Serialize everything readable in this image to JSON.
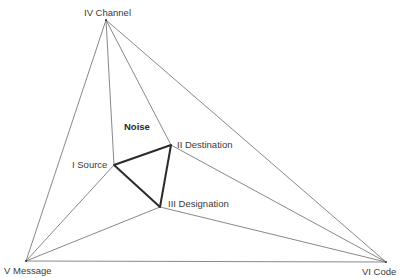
{
  "diagram": {
    "width": 406,
    "height": 278,
    "colors": {
      "thin_line": "#6a6a6a",
      "bold_line": "#2a2a2a",
      "text": "#3a3a3a",
      "background": "#ffffff"
    },
    "nodes": {
      "channel": {
        "label": "IV  Channel",
        "x": 106,
        "y": 20,
        "label_x": 84,
        "label_y": 16
      },
      "source": {
        "label": "I  Source",
        "x": 114,
        "y": 165,
        "label_x": 72,
        "label_y": 168
      },
      "destination": {
        "label": "II  Destination",
        "x": 171,
        "y": 145,
        "label_x": 177,
        "label_y": 148
      },
      "designation": {
        "label": "III  Designation",
        "x": 160,
        "y": 207,
        "label_x": 168,
        "label_y": 207
      },
      "message": {
        "label": "V  Message",
        "x": 26,
        "y": 261,
        "label_x": 4,
        "label_y": 274
      },
      "code": {
        "label": "VI  Code",
        "x": 386,
        "y": 262,
        "label_x": 362,
        "label_y": 275
      }
    },
    "annotation": {
      "text": "Noise",
      "x": 124,
      "y": 130
    },
    "edges_thin": [
      [
        "channel",
        "source"
      ],
      [
        "channel",
        "destination"
      ],
      [
        "channel",
        "message"
      ],
      [
        "channel",
        "code"
      ],
      [
        "message",
        "source"
      ],
      [
        "message",
        "designation"
      ],
      [
        "message",
        "code"
      ],
      [
        "code",
        "destination"
      ],
      [
        "code",
        "designation"
      ]
    ],
    "edges_bold": [
      [
        "source",
        "destination"
      ],
      [
        "destination",
        "designation"
      ],
      [
        "designation",
        "source"
      ]
    ]
  }
}
